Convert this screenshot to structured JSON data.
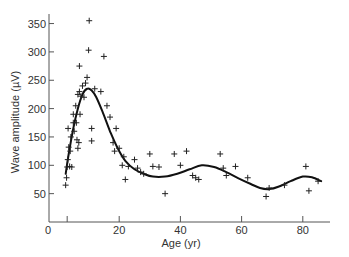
{
  "chart_data": {
    "type": "scatter",
    "title": "",
    "xlabel": "Age (yr)",
    "ylabel": "Wave amplitude (µV)",
    "xlim": [
      0,
      88
    ],
    "ylim": [
      0,
      370
    ],
    "x_ticks": [
      0,
      20,
      40,
      60,
      80
    ],
    "x_tick_labels": [
      "0",
      "20",
      "40",
      "60",
      "80"
    ],
    "y_ticks": [
      50,
      100,
      150,
      200,
      250,
      300,
      350
    ],
    "y_tick_labels": [
      "50",
      "100",
      "150",
      "200",
      "250",
      "300",
      "350"
    ],
    "origin_label": "0",
    "grid": false,
    "legend": null,
    "marker": "+",
    "series": [
      {
        "name": "observations",
        "type": "scatter",
        "points": [
          [
            2.5,
            65
          ],
          [
            2.8,
            78
          ],
          [
            3.0,
            97
          ],
          [
            3.2,
            110
          ],
          [
            3.5,
            132
          ],
          [
            3.3,
            165
          ],
          [
            3.8,
            98
          ],
          [
            4.0,
            125
          ],
          [
            4.2,
            150
          ],
          [
            4.5,
            97
          ],
          [
            5.0,
            175
          ],
          [
            5.0,
            190
          ],
          [
            5.3,
            160
          ],
          [
            5.8,
            205
          ],
          [
            6.0,
            175
          ],
          [
            6.2,
            145
          ],
          [
            6.5,
            225
          ],
          [
            6.5,
            130
          ],
          [
            6.8,
            140
          ],
          [
            7.0,
            230
          ],
          [
            7.2,
            190
          ],
          [
            7.5,
            222
          ],
          [
            7.0,
            275
          ],
          [
            8.0,
            240
          ],
          [
            8.5,
            220
          ],
          [
            9.0,
            245
          ],
          [
            9.5,
            255
          ],
          [
            10.0,
            303
          ],
          [
            10.2,
            355
          ],
          [
            11.0,
            165
          ],
          [
            11.0,
            143
          ],
          [
            12.0,
            235
          ],
          [
            14.0,
            230
          ],
          [
            15.0,
            292
          ],
          [
            16.0,
            205
          ],
          [
            17.0,
            185
          ],
          [
            18.0,
            140
          ],
          [
            18.5,
            125
          ],
          [
            19.0,
            165
          ],
          [
            20.0,
            130
          ],
          [
            21.0,
            100
          ],
          [
            21.5,
            115
          ],
          [
            22.0,
            75
          ],
          [
            23.0,
            98
          ],
          [
            25.0,
            110
          ],
          [
            26.0,
            95
          ],
          [
            27.0,
            88
          ],
          [
            28.0,
            85
          ],
          [
            30.0,
            120
          ],
          [
            31.0,
            98
          ],
          [
            33.0,
            97
          ],
          [
            35.0,
            50
          ],
          [
            38.0,
            120
          ],
          [
            40.0,
            100
          ],
          [
            42.0,
            125
          ],
          [
            44.0,
            82
          ],
          [
            45.0,
            78
          ],
          [
            46.0,
            75
          ],
          [
            53.0,
            120
          ],
          [
            54.0,
            95
          ],
          [
            55.0,
            82
          ],
          [
            58.0,
            98
          ],
          [
            62.0,
            78
          ],
          [
            68.0,
            45
          ],
          [
            69.0,
            60
          ],
          [
            74.0,
            65
          ],
          [
            81.0,
            98
          ],
          [
            82.0,
            55
          ],
          [
            85.0,
            72
          ]
        ]
      },
      {
        "name": "fitted curve",
        "type": "line",
        "points": [
          [
            2.5,
            85
          ],
          [
            3.5,
            120
          ],
          [
            5.0,
            165
          ],
          [
            6.5,
            200
          ],
          [
            8.0,
            225
          ],
          [
            9.5,
            235
          ],
          [
            11.0,
            232
          ],
          [
            12.5,
            220
          ],
          [
            14.5,
            195
          ],
          [
            17.0,
            160
          ],
          [
            19.5,
            130
          ],
          [
            22.0,
            108
          ],
          [
            25.0,
            93
          ],
          [
            28.0,
            85
          ],
          [
            31.0,
            80
          ],
          [
            35.0,
            80
          ],
          [
            39.0,
            85
          ],
          [
            43.0,
            93
          ],
          [
            47.0,
            100
          ],
          [
            51.0,
            97
          ],
          [
            55.0,
            88
          ],
          [
            59.0,
            77
          ],
          [
            63.0,
            67
          ],
          [
            66.0,
            60
          ],
          [
            69.0,
            58
          ],
          [
            72.0,
            62
          ],
          [
            76.0,
            72
          ],
          [
            80.0,
            80
          ],
          [
            83.0,
            79
          ],
          [
            86.0,
            72
          ]
        ]
      }
    ]
  }
}
